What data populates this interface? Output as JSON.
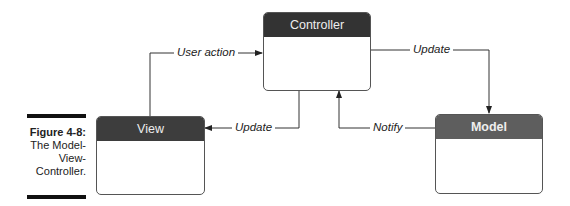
{
  "figure": {
    "number_label": "Figure 4-8:",
    "caption_lines": [
      "The Model-",
      "View-",
      "Controller."
    ]
  },
  "boxes": {
    "controller": {
      "title": "Controller",
      "header_color": "#333333"
    },
    "view": {
      "title": "View",
      "header_color": "#3d3d3d"
    },
    "model": {
      "title": "Model",
      "header_color": "#5e5e5e"
    }
  },
  "arrows": {
    "user_action": "User action",
    "update_to_model": "Update",
    "update_to_view": "Update",
    "notify": "Notify"
  }
}
